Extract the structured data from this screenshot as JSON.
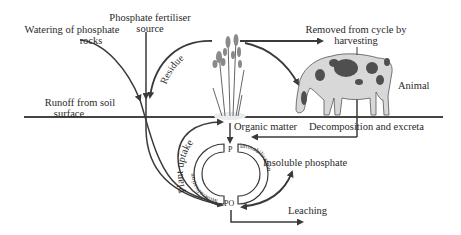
{
  "diagram": {
    "labels": {
      "watering_line1": "Watering of phosphate",
      "watering_line2": "rocks",
      "fertiliser_line1": "Phosphate fertiliser",
      "fertiliser_line2": "source",
      "removed_line1": "Removed from cycle by",
      "removed_line2": "harvesting",
      "animal": "Animal",
      "runoff_line1": "Runoff from soil",
      "runoff_line2": "surface",
      "residue": "Residue",
      "organic_matter": "Organic matter",
      "decomposition": "Decomposition and excreta",
      "plant_uptake": "Plant uptake",
      "insoluble_phosphate": "Insoluble phosphate",
      "leaching": "Leaching",
      "p_top": "P",
      "po_bottom": "PO",
      "mineralisation": "Mineralisation",
      "immobilisation": "Immobilisation"
    },
    "illustrations": [
      "grass-plant",
      "cow-grazing"
    ],
    "colors": {
      "line": "#3a3a3a",
      "text": "#2a2a2a",
      "background": "#ffffff"
    }
  }
}
